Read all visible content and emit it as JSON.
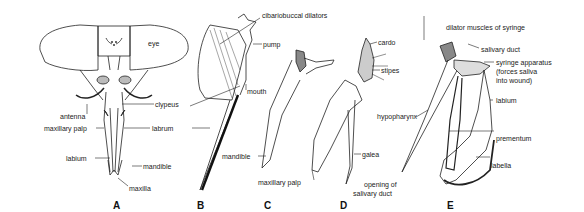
{
  "figure": {
    "panels": [
      {
        "letter": "A",
        "labels": [
          "eye",
          "antenna",
          "clypeus",
          "maxillary palp",
          "labrum",
          "labium",
          "mandible",
          "maxilla"
        ]
      },
      {
        "letter": "B",
        "labels": [
          "cibariobuccal dilators",
          "pump",
          "mouth"
        ]
      },
      {
        "letter": "C",
        "labels": [
          "mandible",
          "maxillary palp"
        ]
      },
      {
        "letter": "D",
        "labels": [
          "cardo",
          "stipes",
          "galea"
        ]
      },
      {
        "letter": "E",
        "labels": [
          "dilator muscles of syringe",
          "salivary duct",
          "syringe apparatus (forces saliva into wound)",
          "labium",
          "hypopharynx",
          "prementum",
          "labella",
          "opening of salivary duct"
        ]
      }
    ],
    "A": {
      "letter": "A",
      "eye": "eye",
      "antenna": "antenna",
      "clypeus": "clypeus",
      "maxillary_palp": "maxillary palp",
      "labrum": "labrum",
      "labium": "labium",
      "mandible": "mandible",
      "maxilla": "maxilla"
    },
    "B": {
      "letter": "B",
      "cibariobuccal": "cibariobuccal dilators",
      "pump": "pump",
      "mouth": "mouth"
    },
    "C": {
      "letter": "C",
      "mandible": "mandible",
      "maxillary_palp": "maxillary palp"
    },
    "D": {
      "letter": "D",
      "cardo": "cardo",
      "stipes": "stipes",
      "galea": "galea",
      "opening_1": "opening of",
      "opening_2": "salivary duct"
    },
    "E": {
      "letter": "E",
      "dilator": "dilator muscles of syringe",
      "salivary_duct": "salivary duct",
      "syringe_1": "syringe apparatus",
      "syringe_2": "(forces saliva",
      "syringe_3": "into wound)",
      "labium": "labium",
      "hypopharynx": "hypopharynx",
      "prementum": "prementum",
      "labella": "labella"
    }
  }
}
